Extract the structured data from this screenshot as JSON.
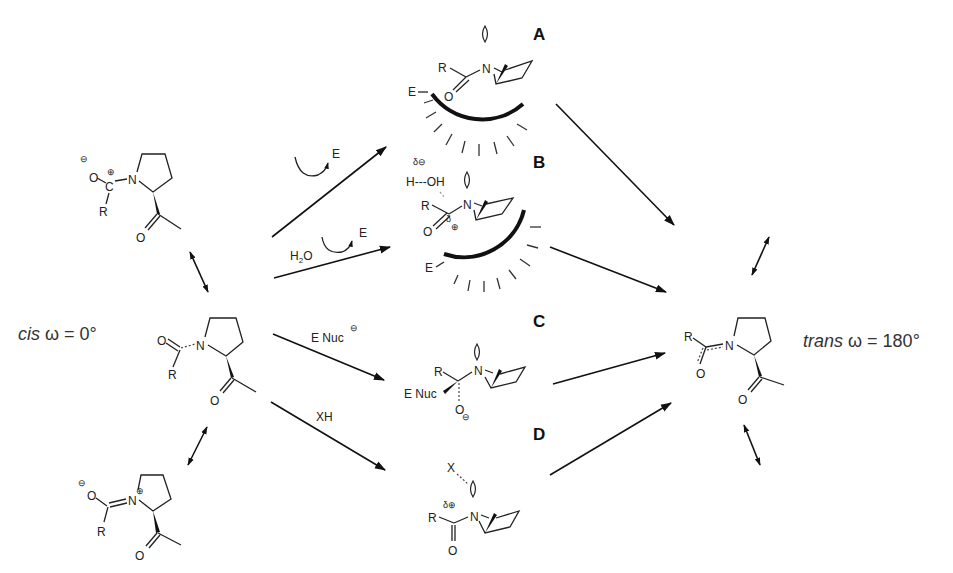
{
  "diagram": {
    "type": "reaction-scheme",
    "left_state": {
      "label_italic": "cis",
      "label_rest": " ω = 0°",
      "resonance_forms": [
        {
          "name": "zwitterion-top",
          "charges": [
            "⊖ on O",
            "⊕ on C"
          ],
          "atoms": [
            "O",
            "C",
            "N",
            "R",
            "O"
          ]
        },
        {
          "name": "neutral-amide-cis",
          "atoms": [
            "O",
            "N",
            "R",
            "O"
          ]
        },
        {
          "name": "zwitterion-bottom",
          "charges": [
            "⊖ on O",
            "⊕ on N"
          ],
          "atoms": [
            "O",
            "N",
            "R",
            "O"
          ]
        }
      ]
    },
    "right_state": {
      "label_italic": "trans",
      "label_rest": " ω = 180°",
      "atoms": [
        "R",
        "N",
        "O",
        "O"
      ]
    },
    "pathways": [
      {
        "label": "A",
        "reagent": "E",
        "reagent_prefix": "",
        "description": "enzyme-bound twisted amide",
        "enzyme_label": "E"
      },
      {
        "label": "B",
        "reagent": "E",
        "reagent_prefix": "H2O",
        "description": "enzyme + water hydrogen bond",
        "enzyme_label": "E",
        "hbond": "H---OH",
        "partial_charges": [
          "δ⊖",
          "δ⊕"
        ]
      },
      {
        "label": "C",
        "reagent": "E Nuc",
        "reagent_charge": "⊖",
        "description": "tetrahedral intermediate",
        "substituents": [
          "R",
          "E Nuc",
          "O⊖"
        ]
      },
      {
        "label": "D",
        "reagent": "XH",
        "description": "N-lone pair interaction with X",
        "partial_charges": [
          "δ⊕"
        ],
        "interacting": "X"
      }
    ],
    "texts": {
      "cis_italic": "cis",
      "cis_rest": " ω = 0°",
      "trans_italic": "trans",
      "trans_rest": " ω = 180°",
      "label_A": "A",
      "label_B": "B",
      "label_C": "C",
      "label_D": "D",
      "E": "E",
      "R": "R",
      "N": "N",
      "O": "O",
      "C": "C",
      "H2O": "H2O",
      "ENuc": "E Nuc",
      "XH": "XH",
      "X": "X",
      "HOH": "H---OH",
      "delta": "δ",
      "minus": "⊖",
      "plus": "⊕"
    }
  }
}
